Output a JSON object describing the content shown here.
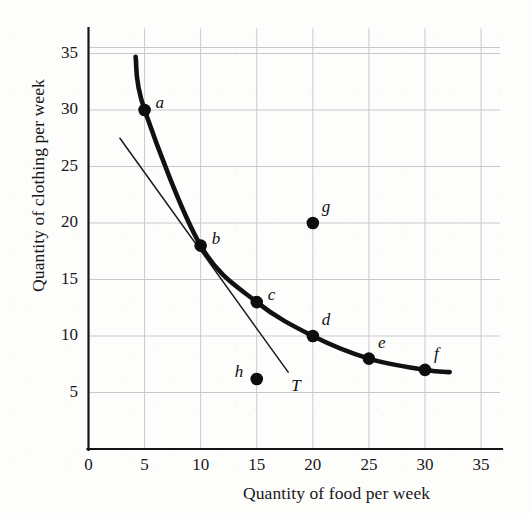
{
  "chart_data": {
    "type": "scatter",
    "title": "",
    "xlabel": "Quantity of food per week",
    "ylabel": "Quantity of clothing per week",
    "xlim": [
      0,
      37
    ],
    "ylim": [
      0,
      37.5
    ],
    "xticks": [
      0,
      5,
      10,
      15,
      20,
      25,
      30,
      35
    ],
    "xtick_labels": [
      "0",
      "5",
      "10",
      "15",
      "20",
      "25",
      "30",
      "35"
    ],
    "yticks": [
      5,
      10,
      15,
      20,
      25,
      30,
      35
    ],
    "ytick_labels": [
      "5",
      "10",
      "15",
      "20",
      "25",
      "30",
      "35"
    ],
    "grid": true,
    "legend": "none",
    "series": [
      {
        "name": "indifference curve",
        "kind": "curve",
        "label": "",
        "points": [
          {
            "x": 4.2,
            "y": 34.7
          },
          {
            "x": 5,
            "y": 30
          },
          {
            "x": 10,
            "y": 18
          },
          {
            "x": 15,
            "y": 13
          },
          {
            "x": 20,
            "y": 10
          },
          {
            "x": 25,
            "y": 8
          },
          {
            "x": 30,
            "y": 7
          },
          {
            "x": 32.2,
            "y": 6.8
          }
        ]
      },
      {
        "name": "tangent line T",
        "kind": "line",
        "label": "T",
        "points": [
          {
            "x": 2.8,
            "y": 27.5
          },
          {
            "x": 17.8,
            "y": 6.8
          }
        ]
      }
    ],
    "markers": [
      {
        "label": "a",
        "x": 5,
        "y": 30,
        "on_curve": true,
        "label_pos": "right"
      },
      {
        "label": "b",
        "x": 10,
        "y": 18,
        "on_curve": true,
        "label_pos": "right"
      },
      {
        "label": "c",
        "x": 15,
        "y": 13,
        "on_curve": true,
        "label_pos": "right"
      },
      {
        "label": "d",
        "x": 20,
        "y": 10,
        "on_curve": true,
        "label_pos": "upper-right"
      },
      {
        "label": "e",
        "x": 25,
        "y": 8,
        "on_curve": true,
        "label_pos": "upper-right"
      },
      {
        "label": "f",
        "x": 30,
        "y": 7,
        "on_curve": true,
        "label_pos": "upper-right"
      },
      {
        "label": "g",
        "x": 20,
        "y": 20,
        "on_curve": false,
        "label_pos": "upper-right"
      },
      {
        "label": "h",
        "x": 15,
        "y": 6.2,
        "on_curve": false,
        "label_pos": "left"
      }
    ],
    "annotations": [
      {
        "text": "T",
        "x": 17.9,
        "y": 5.6
      }
    ]
  },
  "axis_titles": {
    "x": "Quantity of food per week",
    "y": "Quantity of clothing per week"
  },
  "colors": {
    "curve": "#111111",
    "tangent": "#1a1a1a",
    "marker": "#0d0d0d",
    "grid": "#c9c9cc",
    "axis": "#141414",
    "background": "#fdfdfc"
  }
}
